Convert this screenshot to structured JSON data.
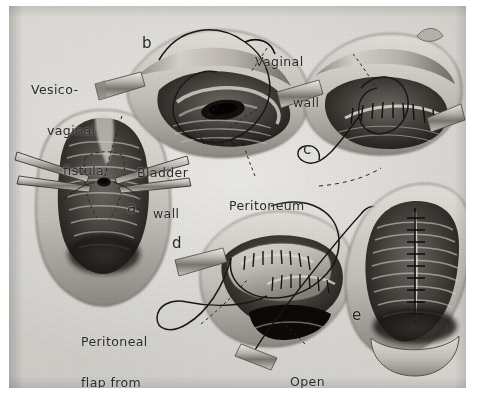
{
  "figure": {
    "kind": "surgical-illustration",
    "ink_color": "#2b2b2b",
    "paper_color": "#d7d5d1"
  },
  "labels": {
    "vesico_vaginal_fistula": {
      "line1": "Vesico-",
      "line2": "vaginal",
      "line3": "fistula"
    },
    "bladder_wall": {
      "line1": "Bladder",
      "line2": "wall"
    },
    "vaginal_wall": {
      "line1": "Vaginal",
      "line2": "wall"
    },
    "peritoneum": {
      "line1": "Peritoneum"
    },
    "peritoneal_flap": {
      "line1": "Peritoneal",
      "line2": "flap from",
      "line3": "cul-de-sac"
    },
    "open_cul_de_sac": {
      "line1": "Open",
      "line2": "cul-de-sac"
    }
  },
  "panels": [
    {
      "letter": "a",
      "name": "panel-a",
      "caption": "Vesico-vaginal fistula exposed with retractors"
    },
    {
      "letter": "b",
      "name": "panel-b",
      "caption": "Bladder wall and vaginal wall separated, suture placed"
    },
    {
      "letter": "c",
      "name": "panel-c",
      "caption": "Bladder wall closure completed"
    },
    {
      "letter": "d",
      "name": "panel-d",
      "caption": "Peritoneal flap from cul-de-sac sutured over repair"
    },
    {
      "letter": "e",
      "name": "panel-e",
      "caption": "Vaginal wall closed"
    }
  ]
}
